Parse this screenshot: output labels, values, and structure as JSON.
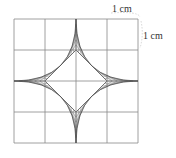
{
  "diagram": {
    "grid": {
      "rows": 4,
      "cols": 4,
      "x0": 14,
      "y0": 19,
      "cell": 31,
      "line_color": "#888888"
    },
    "labels": {
      "top": "1 cm",
      "right": "1 cm"
    },
    "shape": {
      "description": "four-pointed star formed by curved string-art lines around an inner square",
      "hatch_color": "#555555"
    }
  }
}
